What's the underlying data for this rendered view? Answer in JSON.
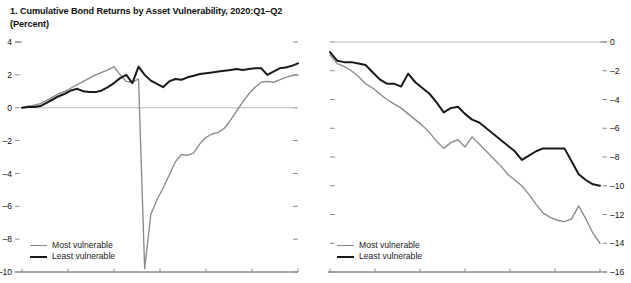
{
  "figure": {
    "background": "#ffffff",
    "panels": [
      {
        "id": "panel-1",
        "title": "1. Cumulative Bond Returns by Asset Vulnerability, 2020:Q1–Q2\n(Percent)"
      },
      {
        "id": "panel-2",
        "title": "2. Cumulative Bond Returns by Asset Vulnerability, 2022:Q1–Q2\n(Percent)"
      }
    ],
    "legend": {
      "most_label": "Most vulnerable",
      "least_label": "Least vulnerable",
      "most_color": "#8a8a8a",
      "least_color": "#1a1a1a"
    }
  },
  "chart_data": [
    {
      "type": "line",
      "title": "1. Cumulative Bond Returns by Asset Vulnerability, 2020:Q1–Q2",
      "subtitle": "(Percent)",
      "xlabel": "",
      "ylabel": "Percent",
      "ylim": [
        -10,
        4
      ],
      "yticks": [
        4,
        2,
        0,
        -2,
        -4,
        -6,
        -8,
        -10
      ],
      "ytick_labels": [
        "4",
        "2",
        "0",
        "-2",
        "-4",
        "-6",
        "-8",
        "-10"
      ],
      "y_axis_side": "left",
      "grid": false,
      "zero_line": true,
      "legend_position": "bottom-left",
      "x": [
        0,
        1,
        2,
        3,
        4,
        5,
        6,
        7,
        8,
        9,
        10,
        11,
        12,
        13,
        14,
        15,
        16,
        17,
        18,
        19,
        20,
        21,
        22,
        23,
        24,
        25,
        26,
        27,
        28,
        29,
        30,
        31,
        32,
        33,
        34,
        35,
        36,
        37,
        38,
        39,
        40,
        41,
        42,
        43,
        44,
        45
      ],
      "n_points": 46,
      "series": [
        {
          "name": "Most vulnerable",
          "color": "#8a8a8a",
          "values": [
            0.0,
            0.1,
            0.15,
            0.25,
            0.45,
            0.65,
            0.85,
            1.0,
            1.2,
            1.4,
            1.6,
            1.8,
            2.0,
            2.15,
            2.3,
            2.5,
            2.0,
            1.6,
            1.55,
            1.75,
            -9.8,
            -6.5,
            -5.6,
            -4.9,
            -4.1,
            -3.3,
            -2.85,
            -2.9,
            -2.75,
            -2.2,
            -1.8,
            -1.6,
            -1.5,
            -1.25,
            -0.75,
            -0.2,
            0.35,
            0.85,
            1.25,
            1.55,
            1.6,
            1.55,
            1.7,
            1.85,
            1.95,
            2.0
          ]
        },
        {
          "name": "Least vulnerable",
          "color": "#1a1a1a",
          "values": [
            0.0,
            0.05,
            0.05,
            0.1,
            0.3,
            0.5,
            0.7,
            0.85,
            1.05,
            1.15,
            1.0,
            0.95,
            0.95,
            1.05,
            1.25,
            1.5,
            1.8,
            2.0,
            1.5,
            2.5,
            2.0,
            1.65,
            1.45,
            1.25,
            1.6,
            1.75,
            1.7,
            1.85,
            1.95,
            2.05,
            2.1,
            2.15,
            2.2,
            2.25,
            2.3,
            2.35,
            2.3,
            2.35,
            2.4,
            2.4,
            2.0,
            2.2,
            2.4,
            2.45,
            2.55,
            2.7
          ]
        }
      ]
    },
    {
      "type": "line",
      "title": "2. Cumulative Bond Returns by Asset Vulnerability, 2022:Q1–Q2",
      "subtitle": "(Percent)",
      "xlabel": "",
      "ylabel": "Percent",
      "ylim": [
        -16,
        0
      ],
      "yticks": [
        0,
        -2,
        -4,
        -6,
        -8,
        -10,
        -12,
        -14,
        -16
      ],
      "ytick_labels": [
        "0",
        "-2",
        "-4",
        "-6",
        "-8",
        "-10",
        "-12",
        "-14",
        "-16"
      ],
      "y_axis_side": "right",
      "grid": false,
      "zero_line": true,
      "legend_position": "bottom-left",
      "x": [
        0,
        1,
        2,
        3,
        4,
        5,
        6,
        7,
        8,
        9,
        10,
        11,
        12,
        13,
        14,
        15,
        16,
        17,
        18,
        19,
        20,
        21,
        22,
        23,
        24,
        25,
        26,
        27,
        28,
        29,
        30,
        31,
        32,
        33,
        34,
        35,
        36,
        37,
        38
      ],
      "n_points": 39,
      "series": [
        {
          "name": "Most vulnerable",
          "color": "#8a8a8a",
          "values": [
            -0.9,
            -1.5,
            -1.7,
            -2.0,
            -2.4,
            -2.9,
            -3.2,
            -3.6,
            -4.0,
            -4.3,
            -4.6,
            -5.0,
            -5.4,
            -5.8,
            -6.3,
            -6.9,
            -7.4,
            -7.0,
            -6.8,
            -7.3,
            -6.6,
            -7.1,
            -7.6,
            -8.1,
            -8.6,
            -9.2,
            -9.6,
            -10.0,
            -10.6,
            -11.3,
            -11.9,
            -12.2,
            -12.4,
            -12.5,
            -12.3,
            -11.4,
            -12.3,
            -13.3,
            -14.0
          ]
        },
        {
          "name": "Least vulnerable",
          "color": "#1a1a1a",
          "values": [
            -0.7,
            -1.3,
            -1.4,
            -1.4,
            -1.5,
            -1.6,
            -2.1,
            -2.6,
            -2.9,
            -2.9,
            -3.1,
            -2.2,
            -2.8,
            -3.2,
            -3.6,
            -4.2,
            -4.9,
            -4.6,
            -4.5,
            -5.0,
            -5.4,
            -5.6,
            -6.0,
            -6.4,
            -6.8,
            -7.2,
            -7.6,
            -8.2,
            -7.9,
            -7.6,
            -7.4,
            -7.4,
            -7.4,
            -7.4,
            -8.3,
            -9.2,
            -9.6,
            -9.9,
            -10.0
          ]
        }
      ]
    }
  ]
}
